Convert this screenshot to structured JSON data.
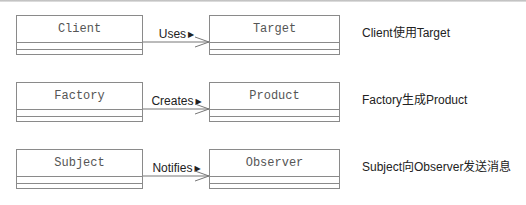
{
  "diagram": {
    "rows": [
      {
        "source": "Client",
        "relation": "Uses",
        "target": "Target",
        "description": "Client使用Target"
      },
      {
        "source": "Factory",
        "relation": "Creates",
        "target": "Product",
        "description": "Factory生成Product"
      },
      {
        "source": "Subject",
        "relation": "Notifies",
        "target": "Observer",
        "description": "Subject向Observer发送消息"
      }
    ],
    "direction_glyph": "▶"
  }
}
